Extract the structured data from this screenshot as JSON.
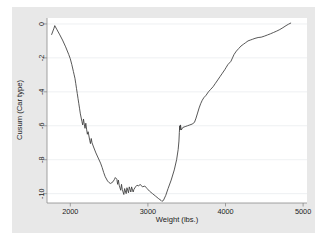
{
  "figure": {
    "background_color": "#e8e8e8",
    "plot_background_color": "#ffffff",
    "line_color": "#3a3a3a",
    "grid_color": "#eceef0",
    "axis_color": "#8a8a8a",
    "text_color": "#222222"
  },
  "chart_data": {
    "type": "line",
    "title": "",
    "subtitle": "",
    "xlabel": "Weight (lbs.)",
    "ylabel": "Cusum (Car type)",
    "xlim": [
      1700,
      5050
    ],
    "ylim": [
      -10.55,
      0.35
    ],
    "xticks": [
      2000,
      3000,
      4000,
      5000
    ],
    "xtick_labels": [
      "2000",
      "3000",
      "4000",
      "5000"
    ],
    "yticks": [
      0,
      -2,
      -4,
      -6,
      -8,
      -10
    ],
    "ytick_labels": [
      "0",
      "-2",
      "-4",
      "-6",
      "-8",
      "-10"
    ],
    "grid": "horizontal",
    "legend": "none",
    "annotations": [],
    "series": [
      {
        "name": "Cusum (Car type)",
        "x": [
          1760,
          1790,
          1800,
          1830,
          1860,
          1900,
          1940,
          1980,
          2000,
          2020,
          2040,
          2050,
          2060,
          2070,
          2080,
          2090,
          2100,
          2110,
          2120,
          2130,
          2150,
          2160,
          2170,
          2180,
          2190,
          2200,
          2210,
          2220,
          2230,
          2240,
          2250,
          2260,
          2270,
          2280,
          2300,
          2330,
          2360,
          2390,
          2410,
          2430,
          2450,
          2480,
          2500,
          2520,
          2550,
          2570,
          2580,
          2600,
          2610,
          2620,
          2630,
          2650,
          2660,
          2670,
          2690,
          2700,
          2720,
          2730,
          2750,
          2760,
          2780,
          2790,
          2810,
          2820,
          2840,
          2860,
          2880,
          2900,
          2930,
          2960,
          2990,
          3020,
          3060,
          3100,
          3140,
          3170,
          3180,
          3200,
          3230,
          3260,
          3300,
          3340,
          3370,
          3390,
          3400,
          3405,
          3410,
          3415,
          3420,
          3430,
          3450,
          3480,
          3510,
          3540,
          3570,
          3600,
          3620,
          3640,
          3660,
          3680,
          3700,
          3720,
          3750,
          3780,
          3810,
          3840,
          3870,
          3900,
          3930,
          3960,
          3990,
          4010,
          4030,
          4050,
          4070,
          4090,
          4110,
          4140,
          4170,
          4200,
          4230,
          4260,
          4290,
          4320,
          4350,
          4380,
          4420,
          4460,
          4500,
          4540,
          4580,
          4620,
          4660,
          4700,
          4740,
          4780,
          4810,
          4840
        ],
        "y": [
          -0.62,
          -0.25,
          -0.1,
          -0.35,
          -0.6,
          -0.95,
          -1.35,
          -1.8,
          -2.05,
          -2.4,
          -2.8,
          -3.0,
          -3.2,
          -3.5,
          -3.8,
          -4.1,
          -4.4,
          -4.7,
          -5.0,
          -5.3,
          -5.75,
          -5.95,
          -5.6,
          -5.9,
          -6.15,
          -5.85,
          -6.2,
          -6.5,
          -6.35,
          -6.6,
          -6.85,
          -7.05,
          -6.75,
          -7.0,
          -7.25,
          -7.6,
          -7.9,
          -8.2,
          -8.45,
          -8.75,
          -9.0,
          -9.25,
          -9.35,
          -9.4,
          -9.3,
          -9.15,
          -9.05,
          -9.15,
          -9.45,
          -9.2,
          -9.5,
          -9.8,
          -9.45,
          -9.75,
          -10.05,
          -9.7,
          -10.0,
          -9.65,
          -9.95,
          -9.6,
          -9.9,
          -9.6,
          -9.9,
          -9.75,
          -9.6,
          -9.5,
          -9.55,
          -9.45,
          -9.6,
          -9.55,
          -9.7,
          -9.85,
          -10.0,
          -10.15,
          -10.3,
          -10.4,
          -10.45,
          -10.4,
          -10.1,
          -9.7,
          -9.2,
          -8.6,
          -8.0,
          -7.4,
          -6.9,
          -6.4,
          -6.0,
          -6.25,
          -5.95,
          -6.25,
          -6.1,
          -6.05,
          -6.0,
          -5.95,
          -5.9,
          -5.8,
          -5.55,
          -5.25,
          -4.95,
          -4.7,
          -4.5,
          -4.35,
          -4.2,
          -4.0,
          -3.85,
          -3.7,
          -3.5,
          -3.3,
          -3.1,
          -2.9,
          -2.7,
          -2.55,
          -2.4,
          -2.3,
          -2.2,
          -2.0,
          -1.8,
          -1.6,
          -1.45,
          -1.3,
          -1.2,
          -1.1,
          -1.0,
          -0.95,
          -0.9,
          -0.85,
          -0.8,
          -0.78,
          -0.72,
          -0.65,
          -0.58,
          -0.5,
          -0.42,
          -0.33,
          -0.22,
          -0.1,
          -0.02,
          0.05
        ]
      }
    ]
  }
}
